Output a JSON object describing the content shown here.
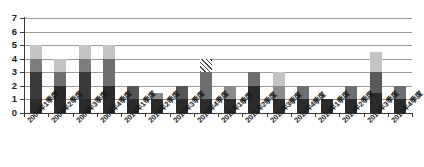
{
  "chart_data": {
    "type": "bar",
    "title": "",
    "subtitle": "",
    "xlabel": "",
    "ylabel": "",
    "grid": true,
    "legend": "none",
    "stacked": true,
    "ylim": [
      0,
      7
    ],
    "yticks": [
      0,
      1,
      2,
      3,
      4,
      5,
      6,
      7
    ],
    "categories": [
      "2009年1季度",
      "2009年2季度",
      "2009年3季度",
      "2009年4季度",
      "2010年1季度",
      "2010年2季度",
      "2010年3季度",
      "2010年4季度",
      "2011年1季度",
      "2011年2季度",
      "2011年3季度",
      "2011年4季度",
      "2012年1季度",
      "2012年2季度",
      "2012年3季度",
      "2012年4季度"
    ],
    "values": [
      5,
      4,
      5,
      5,
      2,
      1.5,
      2,
      4,
      2,
      3,
      3,
      2,
      1,
      2,
      4.5,
      2
    ],
    "segments": [
      [
        {
          "from": 0,
          "to": 1,
          "shade": "#2b2b2b",
          "pattern": "solid"
        },
        {
          "from": 1,
          "to": 3,
          "shade": "#3a3a3a",
          "pattern": "solid"
        },
        {
          "from": 3,
          "to": 4,
          "shade": "#7d7d7d",
          "pattern": "solid"
        },
        {
          "from": 4,
          "to": 5,
          "shade": "#c3c3c3",
          "pattern": "solid"
        }
      ],
      [
        {
          "from": 0,
          "to": 2,
          "shade": "#2b2b2b",
          "pattern": "solid"
        },
        {
          "from": 2,
          "to": 3,
          "shade": "#6e6e6e",
          "pattern": "solid"
        },
        {
          "from": 3,
          "to": 4,
          "shade": "#c3c3c3",
          "pattern": "solid"
        }
      ],
      [
        {
          "from": 0,
          "to": 1,
          "shade": "#2b2b2b",
          "pattern": "solid"
        },
        {
          "from": 1,
          "to": 3,
          "shade": "#3a3a3a",
          "pattern": "solid"
        },
        {
          "from": 3,
          "to": 4,
          "shade": "#7d7d7d",
          "pattern": "solid"
        },
        {
          "from": 4,
          "to": 5,
          "shade": "#c3c3c3",
          "pattern": "solid"
        }
      ],
      [
        {
          "from": 0,
          "to": 2,
          "shade": "#2b2b2b",
          "pattern": "solid"
        },
        {
          "from": 2,
          "to": 4,
          "shade": "#6e6e6e",
          "pattern": "solid"
        },
        {
          "from": 4,
          "to": 5,
          "shade": "#c3c3c3",
          "pattern": "solid"
        }
      ],
      [
        {
          "from": 0,
          "to": 1,
          "shade": "#2b2b2b",
          "pattern": "solid"
        },
        {
          "from": 1,
          "to": 2,
          "shade": "#555555",
          "pattern": "solid"
        }
      ],
      [
        {
          "from": 0,
          "to": 1,
          "shade": "#2b2b2b",
          "pattern": "solid"
        },
        {
          "from": 1,
          "to": 1.5,
          "shade": "#8a8a8a",
          "pattern": "solid"
        }
      ],
      [
        {
          "from": 0,
          "to": 1,
          "shade": "#2b2b2b",
          "pattern": "solid"
        },
        {
          "from": 1,
          "to": 2,
          "shade": "#555555",
          "pattern": "solid"
        }
      ],
      [
        {
          "from": 0,
          "to": 1,
          "shade": "#2b2b2b",
          "pattern": "solid"
        },
        {
          "from": 1,
          "to": 3,
          "shade": "#6e6e6e",
          "pattern": "solid"
        },
        {
          "from": 3,
          "to": 4,
          "shade": "#8a8a8a",
          "pattern": "hatch"
        }
      ],
      [
        {
          "from": 0,
          "to": 1,
          "shade": "#2b2b2b",
          "pattern": "solid"
        },
        {
          "from": 1,
          "to": 2,
          "shade": "#8a8a8a",
          "pattern": "solid"
        }
      ],
      [
        {
          "from": 0,
          "to": 2,
          "shade": "#2b2b2b",
          "pattern": "solid"
        },
        {
          "from": 2,
          "to": 3,
          "shade": "#6e6e6e",
          "pattern": "solid"
        }
      ],
      [
        {
          "from": 0,
          "to": 1,
          "shade": "#2b2b2b",
          "pattern": "solid"
        },
        {
          "from": 1,
          "to": 2,
          "shade": "#8a8a8a",
          "pattern": "solid"
        },
        {
          "from": 2,
          "to": 3,
          "shade": "#c3c3c3",
          "pattern": "solid"
        }
      ],
      [
        {
          "from": 0,
          "to": 1,
          "shade": "#2b2b2b",
          "pattern": "solid"
        },
        {
          "from": 1,
          "to": 2,
          "shade": "#6e6e6e",
          "pattern": "solid"
        }
      ],
      [
        {
          "from": 0,
          "to": 1,
          "shade": "#2b2b2b",
          "pattern": "solid"
        }
      ],
      [
        {
          "from": 0,
          "to": 1,
          "shade": "#2b2b2b",
          "pattern": "solid"
        },
        {
          "from": 1,
          "to": 2,
          "shade": "#6e6e6e",
          "pattern": "solid"
        }
      ],
      [
        {
          "from": 0,
          "to": 1.5,
          "shade": "#2b2b2b",
          "pattern": "solid"
        },
        {
          "from": 1.5,
          "to": 3,
          "shade": "#5a5a5a",
          "pattern": "solid"
        },
        {
          "from": 3,
          "to": 4.5,
          "shade": "#c3c3c3",
          "pattern": "solid"
        }
      ],
      [
        {
          "from": 0,
          "to": 1,
          "shade": "#2b2b2b",
          "pattern": "solid"
        },
        {
          "from": 1,
          "to": 2,
          "shade": "#6e6e6e",
          "pattern": "solid"
        }
      ]
    ]
  },
  "style": {
    "gridline_color": "#9a9a9a",
    "axis_color": "#3a3a3a",
    "background": "#ffffff",
    "label_color": "#1a1a1a"
  }
}
